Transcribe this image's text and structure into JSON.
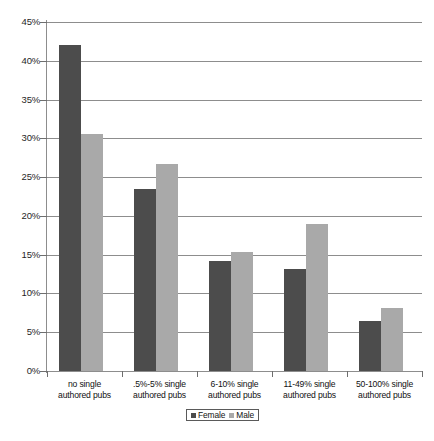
{
  "chart_data": {
    "type": "bar",
    "title": "",
    "subtitle": "",
    "xlabel": "",
    "ylabel": "",
    "ylim": [
      0,
      45
    ],
    "ytick_labels": [
      "45%",
      "40%",
      "35%",
      "30%",
      "25%",
      "20%",
      "15%",
      "10%",
      "5%",
      "0%"
    ],
    "ytick_values": [
      45,
      40,
      35,
      30,
      25,
      20,
      15,
      10,
      5,
      0
    ],
    "grid": true,
    "legend_position": "bottom-center",
    "categories": [
      "no single authored pubs",
      ".5%-5% single authored pubs",
      "6-10% single authored pubs",
      "11-49% single authored pubs",
      "50-100% single authored pubs"
    ],
    "category_lines": [
      [
        "no single",
        "authored pubs"
      ],
      [
        ".5%-5% single",
        "authored pubs"
      ],
      [
        "6-10% single",
        "authored pubs"
      ],
      [
        "11-49% single",
        "authored pubs"
      ],
      [
        "50-100% single",
        "authored pubs"
      ]
    ],
    "series": [
      {
        "name": "Female",
        "color": "#4c4c4c",
        "values": [
          42.0,
          23.5,
          14.2,
          13.2,
          6.5
        ]
      },
      {
        "name": "Male",
        "color": "#a9a9a9",
        "values": [
          30.5,
          26.7,
          15.4,
          18.9,
          8.1
        ]
      }
    ]
  },
  "legend": {
    "items": [
      {
        "label": "Female",
        "marker": "square-dark"
      },
      {
        "label": "Male",
        "marker": "square-light"
      }
    ]
  },
  "colors": {
    "female_bar": "#4c4c4c",
    "male_bar": "#a9a9a9",
    "gridline": "#8d8d8d",
    "axis": "#8d8d8d",
    "text": "#111111",
    "background": "#ffffff"
  }
}
